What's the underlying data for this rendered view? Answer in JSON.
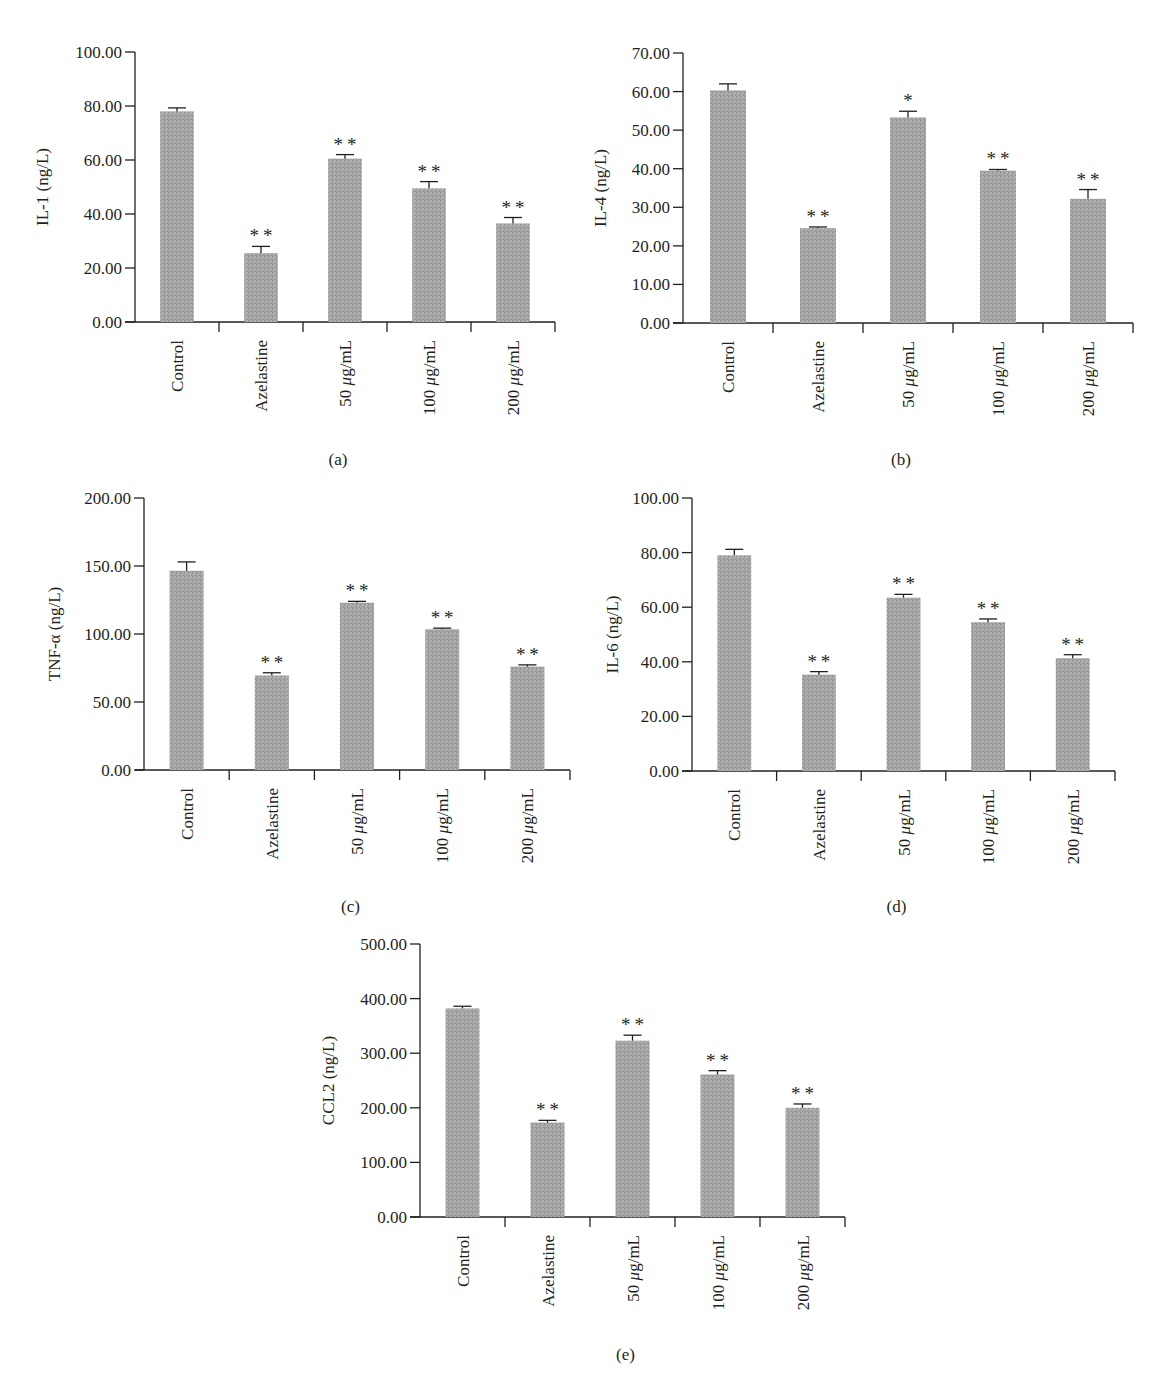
{
  "figure": {
    "panels": [
      "a",
      "b",
      "c",
      "d",
      "e"
    ]
  },
  "chart_data": [
    {
      "id": "a",
      "type": "bar",
      "title": "",
      "caption": "(a)",
      "xlabel": "",
      "ylabel": "IL-1 (ng/L)",
      "ylim": [
        0,
        100
      ],
      "yticks": [
        "0.00",
        "20.00",
        "40.00",
        "60.00",
        "80.00",
        "100.00"
      ],
      "categories": [
        "Control",
        "Azelastine",
        "50 μg/mL",
        "100 μg/mL",
        "200 μg/mL"
      ],
      "values": [
        78.0,
        25.5,
        60.5,
        49.5,
        36.5
      ],
      "errors": [
        1.3,
        2.5,
        1.5,
        2.5,
        2.2
      ],
      "significance": [
        "",
        "**",
        "**",
        "**",
        "**"
      ],
      "grid": false,
      "legend": null
    },
    {
      "id": "b",
      "type": "bar",
      "title": "",
      "caption": "(b)",
      "xlabel": "",
      "ylabel": "IL-4 (ng/L)",
      "ylim": [
        0,
        70
      ],
      "yticks": [
        "0.00",
        "10.00",
        "20.00",
        "30.00",
        "40.00",
        "50.00",
        "60.00",
        "70.00"
      ],
      "categories": [
        "Control",
        "Azelastine",
        "50 μg/mL",
        "100 μg/mL",
        "200 μg/mL"
      ],
      "values": [
        60.3,
        24.6,
        53.3,
        39.5,
        32.2
      ],
      "errors": [
        1.7,
        0.3,
        1.6,
        0.3,
        2.4
      ],
      "significance": [
        "",
        "**",
        "*",
        "**",
        "**"
      ],
      "grid": false,
      "legend": null
    },
    {
      "id": "c",
      "type": "bar",
      "title": "",
      "caption": "(c)",
      "xlabel": "",
      "ylabel": "TNF-α (ng/L)",
      "ylim": [
        0,
        200
      ],
      "yticks": [
        "0.00",
        "50.00",
        "100.00",
        "150.00",
        "200.00"
      ],
      "categories": [
        "Control",
        "Azelastine",
        "50 μg/mL",
        "100 μg/mL",
        "200 μg/mL"
      ],
      "values": [
        146.5,
        69.5,
        123.0,
        103.5,
        76.0
      ],
      "errors": [
        6.5,
        2.0,
        1.0,
        0.8,
        1.3
      ],
      "significance": [
        "",
        "**",
        "**",
        "**",
        "**"
      ],
      "grid": false,
      "legend": null
    },
    {
      "id": "d",
      "type": "bar",
      "title": "",
      "caption": "(d)",
      "xlabel": "",
      "ylabel": "IL-6 (ng/L)",
      "ylim": [
        0,
        100
      ],
      "yticks": [
        "0.00",
        "20.00",
        "40.00",
        "60.00",
        "80.00",
        "100.00"
      ],
      "categories": [
        "Control",
        "Azelastine",
        "50 μg/mL",
        "100 μg/mL",
        "200 μg/mL"
      ],
      "values": [
        79.0,
        35.3,
        63.5,
        54.5,
        41.3
      ],
      "errors": [
        2.2,
        1.1,
        1.2,
        1.2,
        1.3
      ],
      "significance": [
        "",
        "**",
        "**",
        "**",
        "**"
      ],
      "grid": false,
      "legend": null
    },
    {
      "id": "e",
      "type": "bar",
      "title": "",
      "caption": "(e)",
      "xlabel": "",
      "ylabel": "CCL2 (ng/L)",
      "ylim": [
        0,
        500
      ],
      "yticks": [
        "0.00",
        "100.00",
        "200.00",
        "300.00",
        "400.00",
        "500.00"
      ],
      "categories": [
        "Control",
        "Azelastine",
        "50 μg/mL",
        "100 μg/mL",
        "200 μg/mL"
      ],
      "values": [
        382,
        173,
        323,
        261,
        200
      ],
      "errors": [
        4,
        4,
        10,
        7,
        7
      ],
      "significance": [
        "",
        "**",
        "**",
        "**",
        "**"
      ],
      "grid": false,
      "legend": null
    }
  ],
  "colors": {
    "bar": "#a3a3a3",
    "axis": "#231f20",
    "text": "#231f20",
    "background": "#ffffff"
  }
}
